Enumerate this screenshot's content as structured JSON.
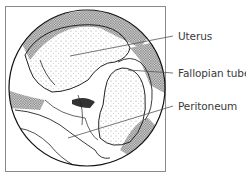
{
  "diagram": {
    "labels": [
      {
        "id": "uterus",
        "text": "Uterus"
      },
      {
        "id": "fallopian-tube",
        "text": "Fallopian tube"
      },
      {
        "id": "peritoneum",
        "text": "Peritoneum"
      }
    ],
    "colors": {
      "line": "#222222",
      "leader": "#555555",
      "frame": "#888888",
      "dark_tissue": "#2a2a2a",
      "stipple": "#9a9a9a",
      "background": "#ffffff"
    }
  }
}
